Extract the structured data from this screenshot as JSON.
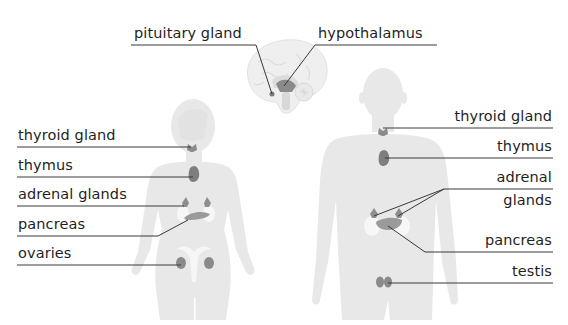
{
  "diagram": {
    "colors": {
      "body": "#e8e8e8",
      "gland": "#8a8a8a",
      "kidney": "#f4f4f4",
      "uterus": "#f6f6f6",
      "leader": "#3a3a3a",
      "text": "#1f1f1f"
    },
    "brain_labels": [
      {
        "id": "pituitary",
        "text": "pituitary gland"
      },
      {
        "id": "hypothalamus",
        "text": "hypothalamus"
      }
    ],
    "female_labels": [
      {
        "id": "thyroid",
        "text": "thyroid gland"
      },
      {
        "id": "thymus",
        "text": "thymus"
      },
      {
        "id": "adrenal",
        "text": "adrenal glands"
      },
      {
        "id": "pancreas",
        "text": "pancreas"
      },
      {
        "id": "ovaries",
        "text": "ovaries"
      }
    ],
    "male_labels": [
      {
        "id": "thyroid",
        "text": "thyroid gland"
      },
      {
        "id": "thymus",
        "text": "thymus"
      },
      {
        "id": "adrenal_1",
        "text": "adrenal"
      },
      {
        "id": "adrenal_2",
        "text": "glands"
      },
      {
        "id": "pancreas",
        "text": "pancreas"
      },
      {
        "id": "testis",
        "text": "testis"
      }
    ]
  }
}
